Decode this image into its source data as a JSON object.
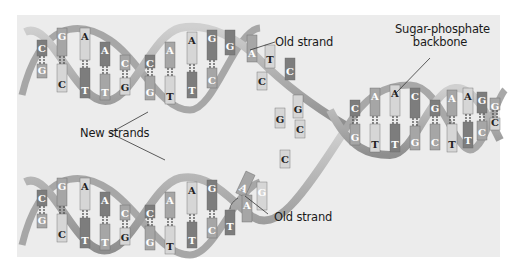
{
  "figure": {
    "background": "#ececec"
  },
  "labels": {
    "old_strand_top": "Old strand",
    "sugar_phosphate_line1": "Sugar-phosphate",
    "sugar_phosphate_line2": "backbone",
    "new_strands": "New strands",
    "old_strand_bottom": "Old strand"
  },
  "colors": {
    "backbone": "#b8b8b8",
    "backbone_dark": "#8a8a8a",
    "base_dark": "#7d7d7d",
    "base_mid": "#a6a6a6",
    "base_light": "#d6d6d6",
    "letter": "#ffffff",
    "letter_dark": "#222222"
  },
  "top_helix": {
    "pairs_left_turn": [
      {
        "top": "C",
        "bottom": "G"
      },
      {
        "top": "G",
        "bottom": "C"
      },
      {
        "top": "A",
        "bottom": "T"
      },
      {
        "top": "A",
        "bottom": "T"
      },
      {
        "top": "C",
        "bottom": "G"
      }
    ],
    "pairs_right_turn": [
      {
        "top": "C",
        "bottom": "G"
      },
      {
        "top": "A",
        "bottom": "T"
      },
      {
        "top": "A",
        "bottom": "T"
      },
      {
        "top": "G",
        "bottom": "C"
      }
    ],
    "unpaired_old": [
      "G",
      "A",
      "T",
      "C"
    ]
  },
  "bottom_helix": {
    "pairs_left_turn": [
      {
        "top": "C",
        "bottom": "G"
      },
      {
        "top": "G",
        "bottom": "C"
      },
      {
        "top": "A",
        "bottom": "T"
      },
      {
        "top": "A",
        "bottom": "T"
      },
      {
        "top": "C",
        "bottom": "G"
      }
    ],
    "pairs_right_turn": [
      {
        "top": "C",
        "bottom": "G"
      },
      {
        "top": "A",
        "bottom": "T"
      },
      {
        "top": "A",
        "bottom": "T"
      },
      {
        "top": "G",
        "bottom": "C"
      }
    ],
    "incoming_nucleotide": "A",
    "pairing_base": "T",
    "unpaired_old": [
      "A",
      "G"
    ]
  },
  "fork_bases": [
    "C",
    "G",
    "G",
    "C",
    "C"
  ],
  "parent_helix": {
    "pairs_turn1": [
      {
        "top": "C",
        "bottom": "G"
      },
      {
        "top": "A",
        "bottom": "T"
      },
      {
        "top": "A",
        "bottom": "T"
      },
      {
        "top": "C",
        "bottom": "G"
      }
    ],
    "pairs_turn2": [
      {
        "top": "G",
        "bottom": "C"
      },
      {
        "top": "A",
        "bottom": "T"
      },
      {
        "top": "A",
        "bottom": "T"
      },
      {
        "top": "G",
        "bottom": "C"
      },
      {
        "top": "G",
        "bottom": "C"
      }
    ]
  }
}
